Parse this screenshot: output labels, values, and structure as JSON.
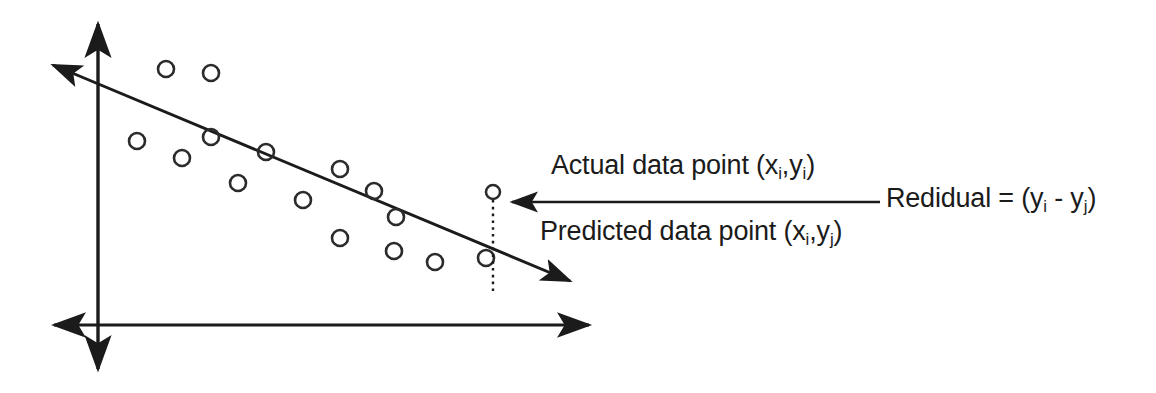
{
  "figure": {
    "type": "regression-residual-diagram",
    "background_color": "#ffffff",
    "ink_color": "#1b1b1b"
  },
  "labels": {
    "actual": {
      "prefix": "Actual data point (x",
      "sub1": "i",
      "mid": ",y",
      "sub2": "i",
      "suffix": ")"
    },
    "predicted": {
      "prefix": "Predicted data point (x",
      "sub1": "i",
      "mid": ",y",
      "sub2": "j",
      "suffix": ")"
    },
    "residual": {
      "prefix": "Redidual = (y",
      "sub1": "i",
      "mid": " - y",
      "sub2": "j",
      "suffix": ")"
    }
  },
  "chart_data": {
    "type": "scatter",
    "title": "",
    "xlabel": "",
    "ylabel": "",
    "grid": false,
    "legend": false,
    "axes": {
      "y_axis": {
        "x": 98,
        "y_top": 18,
        "y_bottom": 375,
        "arrow_top": true,
        "arrow_bottom": true
      },
      "x_axis": {
        "y": 325,
        "x_left": 48,
        "x_right": 595,
        "arrow_left": true,
        "arrow_right": true
      }
    },
    "regression_line": {
      "name": "fitted regression line",
      "x1": 47,
      "y1": 63,
      "x2": 576,
      "y2": 284,
      "arrow_start": true,
      "arrow_end": true,
      "slope": -0.4178
    },
    "point_radius": 8,
    "points": [
      {
        "x": 166,
        "y": 69
      },
      {
        "x": 211,
        "y": 73
      },
      {
        "x": 211,
        "y": 137
      },
      {
        "x": 182,
        "y": 158
      },
      {
        "x": 137,
        "y": 141
      },
      {
        "x": 238,
        "y": 183
      },
      {
        "x": 266,
        "y": 152
      },
      {
        "x": 303,
        "y": 200
      },
      {
        "x": 340,
        "y": 169
      },
      {
        "x": 374,
        "y": 191
      },
      {
        "x": 340,
        "y": 238
      },
      {
        "x": 394,
        "y": 251
      },
      {
        "x": 435,
        "y": 262
      },
      {
        "x": 486,
        "y": 258
      },
      {
        "x": 396,
        "y": 217
      }
    ],
    "highlighted_point": {
      "label": "actual data point",
      "x": 493,
      "y": 192,
      "radius": 7
    },
    "predicted_point": {
      "label": "predicted data point on line",
      "x": 493,
      "y": 292
    },
    "dropline": {
      "style": "dotted",
      "x": 493,
      "y_top": 200,
      "y_bottom": 292
    },
    "residual_arrow": {
      "x_start": 880,
      "x_end": 506,
      "y": 202,
      "direction": "left",
      "points_to": "dropline"
    }
  }
}
